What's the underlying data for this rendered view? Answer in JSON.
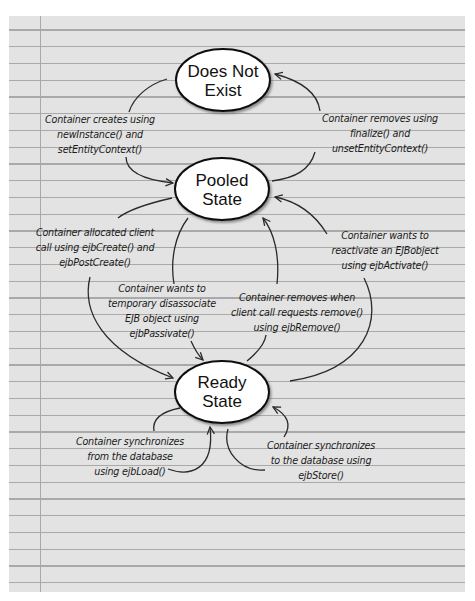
{
  "diagram": {
    "type": "state-lifecycle",
    "states": [
      {
        "id": "does_not_exist",
        "lines": [
          "Does Not",
          "Exist"
        ]
      },
      {
        "id": "pooled_state",
        "lines": [
          "Pooled",
          "State"
        ]
      },
      {
        "id": "ready_state",
        "lines": [
          "Ready",
          "State"
        ]
      }
    ],
    "transitions": [
      {
        "id": "create",
        "from": "does_not_exist",
        "to": "pooled_state",
        "lines": [
          "Container creates using",
          "newInstance() and",
          "setEntityContext()"
        ]
      },
      {
        "id": "finalize",
        "from": "pooled_state",
        "to": "does_not_exist",
        "lines": [
          "Container removes using",
          "finalize() and",
          "unsetEntityContext()"
        ]
      },
      {
        "id": "allocate",
        "from": "pooled_state",
        "to": "ready_state",
        "lines": [
          "Container allocated client",
          "call using ejbCreate() and",
          "ejbPostCreate()"
        ]
      },
      {
        "id": "activate",
        "from": "ready_state",
        "to": "pooled_state",
        "lines": [
          "Container wants to",
          "reactivate an EJBobject",
          "using ejbActivate()"
        ]
      },
      {
        "id": "passivate",
        "from": "pooled_state",
        "to": "ready_state",
        "lines": [
          "Container wants to",
          "temporary disassociate",
          "EJB object using",
          "ejbPassivate()"
        ]
      },
      {
        "id": "remove",
        "from": "ready_state",
        "to": "pooled_state",
        "lines": [
          "Container removes when",
          "client call requests remove()",
          "using ejbRemove()"
        ]
      },
      {
        "id": "load",
        "from": "ready_state",
        "to": "ready_state",
        "lines": [
          "Container synchronizes",
          "from the database",
          "using ejbLoad()"
        ]
      },
      {
        "id": "store",
        "from": "ready_state",
        "to": "ready_state",
        "lines": [
          "Container synchronizes",
          "to the database using",
          "ejbStore()"
        ]
      }
    ],
    "colors": {
      "paper": "#e3e3e3",
      "rule_line": "#a9a9a9",
      "ellipse_fill": "#ffffff",
      "stroke": "#1a1a1a"
    }
  }
}
